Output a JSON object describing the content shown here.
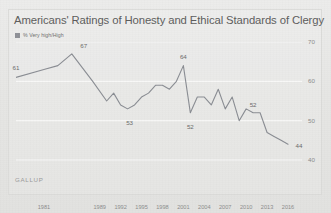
{
  "chart_data": {
    "type": "line",
    "title": "Americans' Ratings of Honesty and Ethical Standards of Clergy",
    "legend": "% Very high/High",
    "legend_position": "top-left",
    "source": "GALLUP",
    "xlabel": "",
    "ylabel": "",
    "ylim": [
      40,
      70
    ],
    "yticks": [
      70,
      60,
      50,
      40
    ],
    "ytick_labels": [
      "70",
      "60",
      "50",
      "40"
    ],
    "y_axis_side": "right",
    "grid": true,
    "xticks": [
      1981,
      1989,
      1992,
      1995,
      1998,
      2001,
      2004,
      2007,
      2010,
      2013,
      2016
    ],
    "xtick_labels": [
      "1981",
      "1989",
      "1992",
      "1995",
      "1998",
      "2001",
      "2004",
      "2007",
      "2010",
      "2013",
      "2016"
    ],
    "xlim": [
      1977,
      2016
    ],
    "line_color": "#8a8d93",
    "x": [
      1977,
      1981,
      1983,
      1985,
      1988,
      1990,
      1991,
      1992,
      1993,
      1994,
      1995,
      1996,
      1997,
      1998,
      1999,
      2000,
      2001,
      2002,
      2003,
      2004,
      2005,
      2006,
      2007,
      2008,
      2009,
      2010,
      2011,
      2012,
      2013,
      2014,
      2015,
      2016
    ],
    "values": [
      61,
      63,
      64,
      67,
      60,
      55,
      57,
      54,
      53,
      54,
      56,
      57,
      59,
      59,
      58,
      60,
      64,
      52,
      56,
      56,
      54,
      58,
      53,
      56,
      50,
      53,
      52,
      52,
      47,
      46,
      45,
      44
    ],
    "point_labels": [
      {
        "x": 1977,
        "value": 61,
        "text": "61"
      },
      {
        "x": 1985,
        "value": 67,
        "text": "67"
      },
      {
        "x": 1993,
        "value": 53,
        "text": "53"
      },
      {
        "x": 2001,
        "value": 64,
        "text": "64"
      },
      {
        "x": 2002,
        "value": 52,
        "text": "52"
      },
      {
        "x": 2011,
        "value": 52,
        "text": "52"
      },
      {
        "x": 2016,
        "value": 44,
        "text": "44"
      }
    ]
  }
}
